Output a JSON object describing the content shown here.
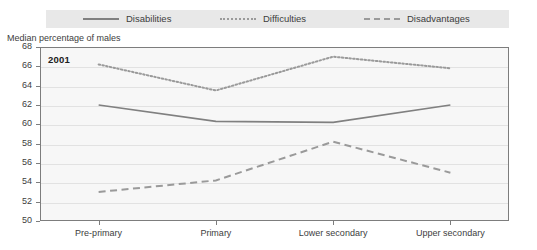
{
  "legend": {
    "items": [
      {
        "label": "Disabilities",
        "style": "solid",
        "color": "#808080"
      },
      {
        "label": "Difficulties",
        "style": "dotted",
        "color": "#9a9a9a"
      },
      {
        "label": "Disadvantages",
        "style": "dashed",
        "color": "#9a9a9a"
      }
    ]
  },
  "axis_title": "Median percentage of males",
  "year_label": "2001",
  "chart_data": {
    "type": "line",
    "title": "",
    "subtitle": "",
    "annotation": "2001",
    "xlabel": "",
    "ylabel": "Median percentage of males",
    "categories": [
      "Pre-primary",
      "Primary",
      "Lower secondary",
      "Upper secondary"
    ],
    "ylim": [
      50,
      68
    ],
    "yticks": [
      50,
      52,
      54,
      56,
      58,
      60,
      62,
      64,
      66,
      68
    ],
    "grid": true,
    "legend_position": "top",
    "series": [
      {
        "name": "Disabilities",
        "style": "solid",
        "color": "#808080",
        "values": [
          62.0,
          60.3,
          60.2,
          62.0
        ]
      },
      {
        "name": "Difficulties",
        "style": "dotted",
        "color": "#9a9a9a",
        "values": [
          66.2,
          63.5,
          67.0,
          65.8
        ]
      },
      {
        "name": "Disadvantages",
        "style": "dashed",
        "color": "#9a9a9a",
        "values": [
          53.0,
          54.2,
          58.2,
          55.0
        ]
      }
    ]
  }
}
